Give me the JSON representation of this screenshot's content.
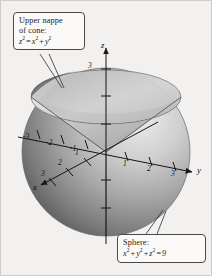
{
  "figure": {
    "type": "3d-surface-plot",
    "background_color": "#f2f1ef"
  },
  "callouts": [
    {
      "id": "cone",
      "name": "upper-nappe-callout",
      "line1": "Upper nappe",
      "line2": "of cone:",
      "equation_lhs": "z",
      "equation_lhs_sup": "2",
      "equation_rel": "=",
      "equation_t1": "x",
      "equation_t1_sup": "2",
      "equation_plus": "+",
      "equation_t2": "y",
      "equation_t2_sup": "2",
      "equation_plain": "z2 = x2 + y2"
    },
    {
      "id": "sphere",
      "name": "sphere-callout",
      "line1": "Sphere:",
      "equation_t1": "x",
      "equation_t1_sup": "2",
      "equation_p1": "+",
      "equation_t2": "y",
      "equation_t2_sup": "2",
      "equation_p2": "+",
      "equation_t3": "z",
      "equation_t3_sup": "2",
      "equation_rel": "=",
      "equation_rhs": "9",
      "equation_plain": "x2 + y2 + z2 = 9"
    }
  ],
  "axes": {
    "x": {
      "label": "x",
      "ticks": [
        "1",
        "2",
        "3"
      ]
    },
    "y": {
      "label": "y",
      "ticks": [
        "1",
        "2",
        "3"
      ]
    },
    "z": {
      "label": "z",
      "ticks": [
        "3"
      ]
    },
    "y_negative_ticks": [
      "-3",
      "-2",
      "-1"
    ]
  },
  "tick_labels": [
    {
      "name": "z-tick-3",
      "text": "3",
      "left": 88,
      "top": 61
    },
    {
      "name": "y-neg-tick-3",
      "text": "-3",
      "left": 23,
      "top": 137
    },
    {
      "name": "y-neg-tick-2",
      "text": "-2",
      "left": 45,
      "top": 143
    },
    {
      "name": "y-neg-tick-1",
      "text": "-1",
      "left": 69,
      "top": 150
    },
    {
      "name": "y-tick-1",
      "text": "1",
      "left": 117,
      "top": 160
    },
    {
      "name": "y-tick-2",
      "text": "2",
      "left": 141,
      "top": 163
    },
    {
      "name": "y-tick-3",
      "text": "3",
      "left": 165,
      "top": 166
    },
    {
      "name": "x-tick-1",
      "text": "1",
      "left": 71,
      "top": 152
    },
    {
      "name": "x-tick-2",
      "text": "2",
      "left": 54,
      "top": 163
    },
    {
      "name": "x-tick-3",
      "text": "3",
      "left": 40,
      "top": 174
    }
  ],
  "axis_names": [
    {
      "name": "z-axis-label",
      "text": "z",
      "left": 101,
      "top": 42
    },
    {
      "name": "y-axis-label",
      "text": "y",
      "left": 196,
      "top": 168
    },
    {
      "name": "x-axis-label",
      "text": "x",
      "left": 34,
      "top": 185
    }
  ],
  "colors": {
    "sphere_light": "#e9e9e9",
    "sphere_mid": "#9a9a9a",
    "sphere_dark": "#4e4e4e",
    "cone_light": "#d7d7d7",
    "cone_dark": "#5d5d5d",
    "axis": "#1a1a1a",
    "callout_border": "#4a4a4a",
    "callout_fill": "#fbfaf8"
  }
}
